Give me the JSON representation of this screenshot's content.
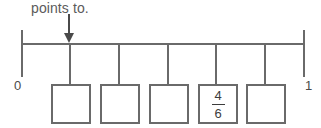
{
  "diagram": {
    "type": "number-line-with-answer-boxes",
    "prompt": "points to.",
    "line": {
      "start_label": "0",
      "end_label": "1",
      "start_value": 0,
      "end_value": 1
    },
    "pointer": {
      "icon": "down-arrow-icon",
      "target_tick_index": 1
    },
    "ticks": [
      {
        "index": 0,
        "x": 21
      },
      {
        "index": 1,
        "x": 69
      },
      {
        "index": 2,
        "x": 118
      },
      {
        "index": 3,
        "x": 167
      },
      {
        "index": 4,
        "x": 215
      },
      {
        "index": 5,
        "x": 264
      },
      {
        "index": 6,
        "x": 304
      }
    ],
    "boxes": [
      {
        "index": 0,
        "stem_x": 69,
        "box_left": 51,
        "value": "",
        "filled": false
      },
      {
        "index": 1,
        "stem_x": 118,
        "box_left": 100,
        "value": "",
        "filled": false
      },
      {
        "index": 2,
        "stem_x": 167,
        "box_left": 149,
        "value": "",
        "filled": false
      },
      {
        "index": 3,
        "stem_x": 215,
        "box_left": 198,
        "value": "4/6",
        "filled": true,
        "numerator": "4",
        "denominator": "6"
      },
      {
        "index": 4,
        "stem_x": 264,
        "box_left": 246,
        "value": "",
        "filled": false
      }
    ],
    "colors": {
      "line": "#6a6a6a",
      "text": "#4a4a4a",
      "prompt_text": "#5b5b5b",
      "background": "#ffffff"
    }
  }
}
